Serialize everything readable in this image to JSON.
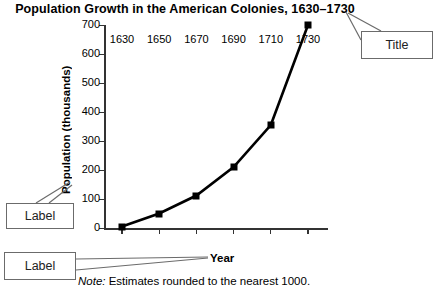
{
  "chart_data": {
    "type": "line",
    "title": "Population Growth in the American Colonies, 1630–1730",
    "xlabel": "Year",
    "ylabel": "Population (thousands)",
    "x": [
      1630,
      1650,
      1670,
      1690,
      1710,
      1730
    ],
    "categories": [
      "1630",
      "1650",
      "1670",
      "1690",
      "1710",
      "1730"
    ],
    "values": [
      5,
      50,
      112,
      210,
      355,
      700
    ],
    "series": [
      {
        "name": "Population",
        "values": [
          5,
          50,
          112,
          210,
          355,
          700
        ],
        "marker": "square",
        "color": "#000000"
      }
    ],
    "ylim": [
      0,
      700
    ],
    "yticks": [
      0,
      100,
      200,
      300,
      400,
      500,
      600,
      700
    ],
    "ytick_labels": [
      "0",
      "100",
      "200",
      "300",
      "400",
      "500",
      "600",
      "700"
    ],
    "xlim": [
      1630,
      1730
    ],
    "grid": false,
    "legend": false,
    "note": "Note: Estimates rounded to the nearest 1000.",
    "note_prefix": "Note:",
    "note_body": " Estimates rounded to the nearest 1000."
  },
  "annotations": {
    "title_callout": "Title",
    "ylabel_callout": "Label",
    "xlabel_callout": "Label"
  },
  "colors": {
    "line": "#000000",
    "marker": "#000000",
    "axis": "#333333",
    "callout_border": "#6b6b6b",
    "background": "#ffffff"
  }
}
